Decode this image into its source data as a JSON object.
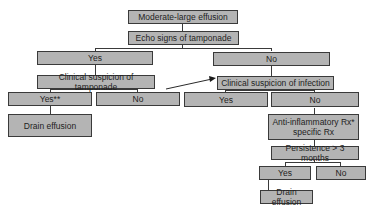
{
  "diagram": {
    "type": "flowchart",
    "nodes": {
      "root": "Moderate-large effusion",
      "echo": "Echo signs of tamponade",
      "echo_yes": "Yes",
      "echo_no": "No",
      "clin_tamp": "Clinical suspicion of tamponade",
      "clin_inf": "Clinical suspicion of infection",
      "tamp_yes": "Yes**",
      "tamp_no": "No",
      "inf_yes": "Yes",
      "inf_no": "No",
      "drain1": "Drain effusion",
      "anti_line1": "Anti-inflammatory Rx*",
      "anti_line2": "specific Rx",
      "persist": "Persistence > 3 months",
      "persist_yes": "Yes",
      "persist_no": "No",
      "drain2": "Drain effusion"
    },
    "edges": [
      [
        "root",
        "echo"
      ],
      [
        "echo",
        "echo_yes"
      ],
      [
        "echo",
        "echo_no"
      ],
      [
        "echo_yes",
        "clin_tamp"
      ],
      [
        "echo_no",
        "clin_inf"
      ],
      [
        "clin_tamp",
        "tamp_yes"
      ],
      [
        "clin_tamp",
        "tamp_no"
      ],
      [
        "tamp_no",
        "clin_inf",
        "arrow"
      ],
      [
        "clin_inf",
        "inf_yes"
      ],
      [
        "clin_inf",
        "inf_no"
      ],
      [
        "tamp_yes",
        "drain1"
      ],
      [
        "inf_no",
        "anti"
      ],
      [
        "anti",
        "persist"
      ],
      [
        "persist",
        "persist_yes"
      ],
      [
        "persist",
        "persist_no"
      ],
      [
        "persist_yes",
        "drain2"
      ]
    ],
    "colors": {
      "box_fill": "#b4b4b4",
      "border": "#3a3a3a",
      "text": "#1e1e1e"
    }
  }
}
